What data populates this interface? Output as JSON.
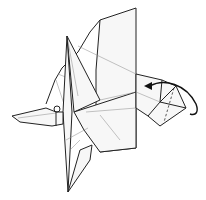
{
  "diagram": {
    "type": "origami-folding-step",
    "annotations": [
      {
        "kind": "valley-fold-line",
        "description": "dashed line on right flap"
      },
      {
        "kind": "fold-arrow",
        "description": "curved arrow folding right flap over to the left"
      }
    ],
    "colors": {
      "line": "#222222",
      "paper": "#f7f7f7",
      "background": "#ffffff"
    }
  }
}
